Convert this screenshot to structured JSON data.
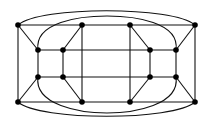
{
  "diagram": {
    "type": "graph",
    "stroke_color": "#111111",
    "node_color": "#000000",
    "background": "#ffffff",
    "nodes": [
      {
        "id": "TL",
        "x": 18,
        "y": 25
      },
      {
        "id": "T2",
        "x": 82,
        "y": 25
      },
      {
        "id": "T3",
        "x": 130,
        "y": 25
      },
      {
        "id": "TR",
        "x": 195,
        "y": 25
      },
      {
        "id": "A1",
        "x": 38,
        "y": 50
      },
      {
        "id": "A2",
        "x": 63,
        "y": 50
      },
      {
        "id": "A3",
        "x": 150,
        "y": 50
      },
      {
        "id": "A4",
        "x": 176,
        "y": 50
      },
      {
        "id": "B1",
        "x": 38,
        "y": 77
      },
      {
        "id": "B2",
        "x": 63,
        "y": 77
      },
      {
        "id": "B3",
        "x": 150,
        "y": 77
      },
      {
        "id": "B4",
        "x": 176,
        "y": 77
      },
      {
        "id": "BL",
        "x": 18,
        "y": 102
      },
      {
        "id": "Bt2",
        "x": 82,
        "y": 102
      },
      {
        "id": "Bt3",
        "x": 130,
        "y": 102
      },
      {
        "id": "BR",
        "x": 195,
        "y": 102
      }
    ],
    "edges": [
      [
        "TL",
        "TR"
      ],
      [
        "BL",
        "BR"
      ],
      [
        "TL",
        "BL"
      ],
      [
        "TR",
        "BR"
      ],
      [
        "T2",
        "Bt2"
      ],
      [
        "T3",
        "Bt3"
      ],
      [
        "A1",
        "A4"
      ],
      [
        "B1",
        "B4"
      ],
      [
        "A1",
        "B1"
      ],
      [
        "A2",
        "B2"
      ],
      [
        "A3",
        "B3"
      ],
      [
        "A4",
        "B4"
      ],
      [
        "TL",
        "A1"
      ],
      [
        "T2",
        "A2"
      ],
      [
        "T3",
        "A3"
      ],
      [
        "TR",
        "A4"
      ],
      [
        "BL",
        "B1"
      ],
      [
        "Bt2",
        "B2"
      ],
      [
        "Bt3",
        "B3"
      ],
      [
        "BR",
        "B4"
      ]
    ],
    "curved_edges": [
      {
        "id": "outer-top-arc",
        "from": "TL",
        "to": "TR"
      },
      {
        "id": "outer-bottom-arc",
        "from": "BL",
        "to": "BR"
      },
      {
        "id": "inner-top-arc",
        "from": "A1",
        "to": "A4"
      },
      {
        "id": "inner-bottom-arc",
        "from": "B1",
        "to": "B4"
      }
    ]
  }
}
